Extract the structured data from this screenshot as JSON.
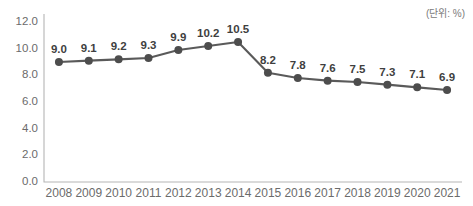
{
  "unit_note": "(단위: %)",
  "chart_data": {
    "type": "line",
    "title": "",
    "subtitle": "",
    "xlabel": "",
    "ylabel": "",
    "categories": [
      "2008",
      "2009",
      "2010",
      "2011",
      "2012",
      "2013",
      "2014",
      "2015",
      "2016",
      "2017",
      "2018",
      "2019",
      "2020",
      "2021"
    ],
    "values": [
      9.0,
      9.1,
      9.2,
      9.3,
      9.9,
      10.2,
      10.5,
      8.2,
      7.8,
      7.6,
      7.5,
      7.3,
      7.1,
      6.9
    ],
    "point_labels": [
      "9.0",
      "9.1",
      "9.2",
      "9.3",
      "9.9",
      "10.2",
      "10.5",
      "8.2",
      "7.8",
      "7.6",
      "7.5",
      "7.3",
      "7.1",
      "6.9"
    ],
    "ylim": [
      0.0,
      12.0
    ],
    "yticks": [
      0.0,
      2.0,
      4.0,
      6.0,
      8.0,
      10.0,
      12.0
    ],
    "ytick_labels": [
      "0.0",
      "2.0",
      "4.0",
      "6.0",
      "8.0",
      "10.0",
      "12.0"
    ],
    "grid": false,
    "legend": "none",
    "series_color": "#4d4d4d",
    "line_color": "#5a5a5a",
    "axis_color": "#b5b5b5",
    "label_color": "#6b6b6b",
    "background": "#ffffff"
  }
}
